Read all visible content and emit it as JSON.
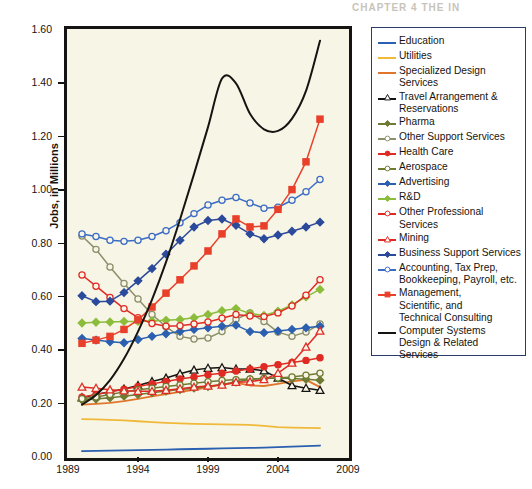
{
  "page_header": "CHAPTER 4   THE IN",
  "ghost_text": {
    "line1": "WITH TACTICS",
    "line2": "AS INNOVATION'S CORE",
    "line3": "GAP"
  },
  "chart_data": {
    "type": "line",
    "title": "",
    "xlabel": "",
    "ylabel": "Jobs, in Millions",
    "xlim": [
      1989,
      2009
    ],
    "ylim": [
      0.0,
      1.6
    ],
    "ytick_labels": [
      "1.60",
      "1.40",
      "1.20",
      "1.00",
      "0.80",
      "0.60",
      "0.40",
      "0.20",
      "0.00"
    ],
    "ytick_values": [
      1.6,
      1.4,
      1.2,
      1.0,
      0.8,
      0.6,
      0.4,
      0.2,
      0.0
    ],
    "xtick_labels": [
      "1989",
      "1994",
      "1999",
      "2004",
      "2009"
    ],
    "xtick_values": [
      1989,
      1994,
      1999,
      2004,
      2009
    ],
    "grid": false,
    "legend_position": "right",
    "x": [
      1990,
      1991,
      1992,
      1993,
      1994,
      1995,
      1996,
      1997,
      1998,
      1999,
      2000,
      2001,
      2002,
      2003,
      2004,
      2005,
      2006,
      2007
    ],
    "series": [
      {
        "name": "Education",
        "color": "#2b5fb0",
        "marker": "none",
        "values": [
          0.022,
          0.023,
          0.024,
          0.025,
          0.026,
          0.027,
          0.028,
          0.029,
          0.03,
          0.031,
          0.032,
          0.033,
          0.034,
          0.035,
          0.037,
          0.039,
          0.041,
          0.043
        ]
      },
      {
        "name": "Utilities",
        "color": "#f0b93b",
        "marker": "none",
        "values": [
          0.142,
          0.141,
          0.139,
          0.137,
          0.134,
          0.131,
          0.128,
          0.126,
          0.124,
          0.123,
          0.122,
          0.121,
          0.12,
          0.117,
          0.112,
          0.11,
          0.109,
          0.108
        ]
      },
      {
        "name": "Specialized Design Services",
        "color": "#e0762b",
        "marker": "none",
        "values": [
          0.196,
          0.199,
          0.203,
          0.209,
          0.218,
          0.227,
          0.236,
          0.244,
          0.252,
          0.261,
          0.272,
          0.278,
          0.268,
          0.266,
          0.274,
          0.283,
          0.289,
          0.262
        ]
      },
      {
        "name": "Travel Arrangement & Reservations",
        "color": "#161412",
        "marker": "triangle-open",
        "values": [
          0.222,
          0.234,
          0.245,
          0.255,
          0.268,
          0.283,
          0.296,
          0.312,
          0.326,
          0.333,
          0.335,
          0.33,
          0.33,
          0.323,
          0.296,
          0.268,
          0.258,
          0.25
        ]
      },
      {
        "name": "Pharma",
        "color": "#6f7a33",
        "marker": "diamond",
        "values": [
          0.214,
          0.217,
          0.222,
          0.228,
          0.234,
          0.241,
          0.247,
          0.253,
          0.258,
          0.264,
          0.272,
          0.281,
          0.291,
          0.295,
          0.296,
          0.294,
          0.291,
          0.288
        ]
      },
      {
        "name": "Other Support Services",
        "color": "#8b8f6a",
        "marker": "circle-open",
        "values": [
          0.828,
          0.778,
          0.712,
          0.65,
          0.592,
          0.534,
          0.488,
          0.452,
          0.442,
          0.446,
          0.47,
          0.516,
          0.54,
          0.508,
          0.468,
          0.452,
          0.468,
          0.498
        ]
      },
      {
        "name": "Health Care",
        "color": "#e02b24",
        "marker": "circle-filled",
        "values": [
          0.224,
          0.234,
          0.244,
          0.254,
          0.264,
          0.274,
          0.283,
          0.292,
          0.3,
          0.308,
          0.314,
          0.322,
          0.33,
          0.338,
          0.346,
          0.354,
          0.362,
          0.372
        ]
      },
      {
        "name": "Aerospace",
        "color": "#6f7a33",
        "marker": "circle-open",
        "values": [
          0.218,
          0.225,
          0.234,
          0.244,
          0.252,
          0.258,
          0.264,
          0.27,
          0.276,
          0.282,
          0.287,
          0.29,
          0.292,
          0.294,
          0.296,
          0.3,
          0.306,
          0.314
        ]
      },
      {
        "name": "Advertising",
        "color": "#2b5fb0",
        "marker": "diamond",
        "values": [
          0.444,
          0.438,
          0.432,
          0.428,
          0.44,
          0.452,
          0.462,
          0.47,
          0.478,
          0.484,
          0.49,
          0.494,
          0.47,
          0.466,
          0.472,
          0.478,
          0.484,
          0.49
        ]
      },
      {
        "name": "R&D",
        "color": "#8cbc3b",
        "marker": "diamond",
        "values": [
          0.502,
          0.505,
          0.506,
          0.508,
          0.508,
          0.51,
          0.512,
          0.515,
          0.522,
          0.534,
          0.548,
          0.556,
          0.538,
          0.53,
          0.546,
          0.57,
          0.6,
          0.628
        ]
      },
      {
        "name": "Other Professional Services",
        "color": "#e02b24",
        "marker": "circle-open",
        "values": [
          0.682,
          0.64,
          0.598,
          0.556,
          0.522,
          0.5,
          0.49,
          0.492,
          0.498,
          0.506,
          0.52,
          0.534,
          0.528,
          0.526,
          0.54,
          0.566,
          0.606,
          0.664
        ]
      },
      {
        "name": "Mining",
        "color": "#e02b24",
        "marker": "triangle-open",
        "values": [
          0.262,
          0.258,
          0.252,
          0.248,
          0.246,
          0.246,
          0.25,
          0.256,
          0.262,
          0.266,
          0.27,
          0.28,
          0.282,
          0.29,
          0.314,
          0.352,
          0.412,
          0.472
        ]
      },
      {
        "name": "Business Support Services",
        "color": "#2b4a9b",
        "marker": "diamond",
        "values": [
          0.604,
          0.582,
          0.584,
          0.616,
          0.66,
          0.706,
          0.76,
          0.812,
          0.862,
          0.886,
          0.892,
          0.868,
          0.836,
          0.818,
          0.832,
          0.846,
          0.862,
          0.88
        ]
      },
      {
        "name": "Accounting, Tax Prep, Bookkeeping, Payroll, etc.",
        "color": "#3b6cc4",
        "marker": "circle-open",
        "values": [
          0.836,
          0.826,
          0.812,
          0.808,
          0.812,
          0.826,
          0.848,
          0.878,
          0.912,
          0.944,
          0.962,
          0.972,
          0.952,
          0.932,
          0.936,
          0.962,
          0.994,
          1.04
        ]
      },
      {
        "name": "Management, Scientific, and Technical Consulting",
        "color": "#e8402b",
        "marker": "square-filled",
        "values": [
          0.426,
          0.438,
          0.452,
          0.478,
          0.514,
          0.562,
          0.614,
          0.664,
          0.716,
          0.772,
          0.836,
          0.892,
          0.862,
          0.866,
          0.928,
          1.002,
          1.106,
          1.266
        ]
      },
      {
        "name": "Computer Systems Design & Related Services",
        "color": "#161412",
        "marker": "none",
        "values": [
          0.196,
          0.232,
          0.288,
          0.368,
          0.47,
          0.59,
          0.73,
          0.89,
          1.06,
          1.236,
          1.418,
          1.4,
          1.286,
          1.228,
          1.222,
          1.268,
          1.372,
          1.56
        ]
      }
    ]
  },
  "legend": {
    "entries": [
      {
        "label": "Education"
      },
      {
        "label": "Utilities"
      },
      {
        "label": "Specialized Design Services"
      },
      {
        "label": "Travel Arrangement &\nReservations"
      },
      {
        "label": "Pharma"
      },
      {
        "label": "Other Support Services"
      },
      {
        "label": "Health Care"
      },
      {
        "label": "Aerospace"
      },
      {
        "label": "Advertising"
      },
      {
        "label": "R&D"
      },
      {
        "label": "Other Professional Services"
      },
      {
        "label": "Mining"
      },
      {
        "label": "Business Support Services"
      },
      {
        "label": " Accounting, Tax Prep,\n Bookkeeping, Payroll, etc."
      },
      {
        "label": "Management,\nScientific, and\nTechnical Consulting"
      },
      {
        "label": "Computer Systems\nDesign & Related\nServices"
      }
    ]
  },
  "colors": {
    "plot_background": "#f7f5e6",
    "frame": "#161412",
    "legend_border": "#2b3a67",
    "page_background": "#ffffff"
  }
}
